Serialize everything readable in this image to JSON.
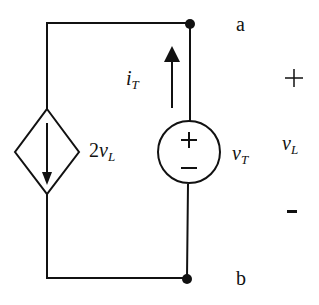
{
  "diagram": {
    "type": "circuit",
    "terminals": {
      "top": "a",
      "bottom": "b"
    },
    "dependent_source": {
      "type": "current",
      "value_coeff": "2",
      "value_var": "v",
      "value_sub": "L",
      "arrow": "down"
    },
    "test_source": {
      "type": "voltage",
      "var": "v",
      "sub": "T",
      "plus": "+",
      "minus": "−"
    },
    "current": {
      "var": "i",
      "sub": "T",
      "direction": "up"
    },
    "load_voltage": {
      "var": "v",
      "sub": "L",
      "plus": "+",
      "minus": "-"
    },
    "colors": {
      "stroke": "#111111",
      "background": "#ffffff"
    }
  }
}
